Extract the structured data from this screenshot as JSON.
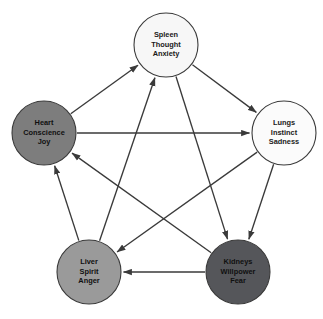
{
  "diagram": {
    "background_color": "#ffffff",
    "line_color": "#3a3a3a",
    "nodes": [
      {
        "id": "spleen",
        "lines": [
          "Spleen",
          "Thought",
          "Anxiety"
        ],
        "line1": "Spleen",
        "line2": "Thought",
        "line3": "Anxiety",
        "cx": 166,
        "cy": 45,
        "r": 32,
        "fill": "#f7f7f7",
        "text_tone": "dark"
      },
      {
        "id": "lungs",
        "lines": [
          "Lungs",
          "Instinct",
          "Sadness"
        ],
        "line1": "Lungs",
        "line2": "Instinct",
        "line3": "Sadness",
        "cx": 284,
        "cy": 133,
        "r": 32,
        "fill": "#fbfbfb",
        "text_tone": "dark"
      },
      {
        "id": "kidneys",
        "lines": [
          "Kidneys",
          "Willpower",
          "Fear"
        ],
        "line1": "Kidneys",
        "line2": "Willpower",
        "line3": "Fear",
        "cx": 238,
        "cy": 272,
        "r": 32,
        "fill": "#55565a",
        "text_tone": "light"
      },
      {
        "id": "liver",
        "lines": [
          "Liver",
          "Spirit",
          "Anger"
        ],
        "line1": "Liver",
        "line2": "Spirit",
        "line3": "Anger",
        "cx": 89,
        "cy": 272,
        "r": 32,
        "fill": "#9a9a9a",
        "text_tone": "light"
      },
      {
        "id": "heart",
        "lines": [
          "Heart",
          "Conscience",
          "Joy"
        ],
        "line1": "Heart",
        "line2": "Conscience",
        "line3": "Joy",
        "cx": 44,
        "cy": 133,
        "r": 32,
        "fill": "#7d7d7d",
        "text_tone": "light"
      }
    ],
    "edges": [
      {
        "from": "heart",
        "to": "spleen",
        "cycle": "outer"
      },
      {
        "from": "spleen",
        "to": "lungs",
        "cycle": "outer"
      },
      {
        "from": "lungs",
        "to": "kidneys",
        "cycle": "outer"
      },
      {
        "from": "kidneys",
        "to": "liver",
        "cycle": "outer"
      },
      {
        "from": "liver",
        "to": "heart",
        "cycle": "outer"
      },
      {
        "from": "liver",
        "to": "spleen",
        "cycle": "inner"
      },
      {
        "from": "spleen",
        "to": "kidneys",
        "cycle": "inner"
      },
      {
        "from": "kidneys",
        "to": "heart",
        "cycle": "inner"
      },
      {
        "from": "heart",
        "to": "lungs",
        "cycle": "inner"
      },
      {
        "from": "lungs",
        "to": "liver",
        "cycle": "inner"
      }
    ]
  }
}
